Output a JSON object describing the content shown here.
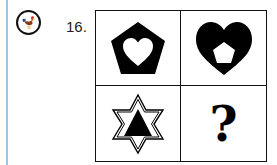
{
  "question": {
    "number_label": "16.",
    "badge_icon": "rooster-icon",
    "accent_line_color": "#9cc6e6"
  },
  "grid": {
    "cells": [
      {
        "position": "top-left",
        "figure": "black pentagon with white heart inside"
      },
      {
        "position": "top-right",
        "figure": "black heart with white pentagon inside"
      },
      {
        "position": "bottom-left",
        "figure": "outlined six-pointed star with black triangle inside"
      },
      {
        "position": "bottom-right",
        "figure": "question mark",
        "label": "?"
      }
    ]
  }
}
